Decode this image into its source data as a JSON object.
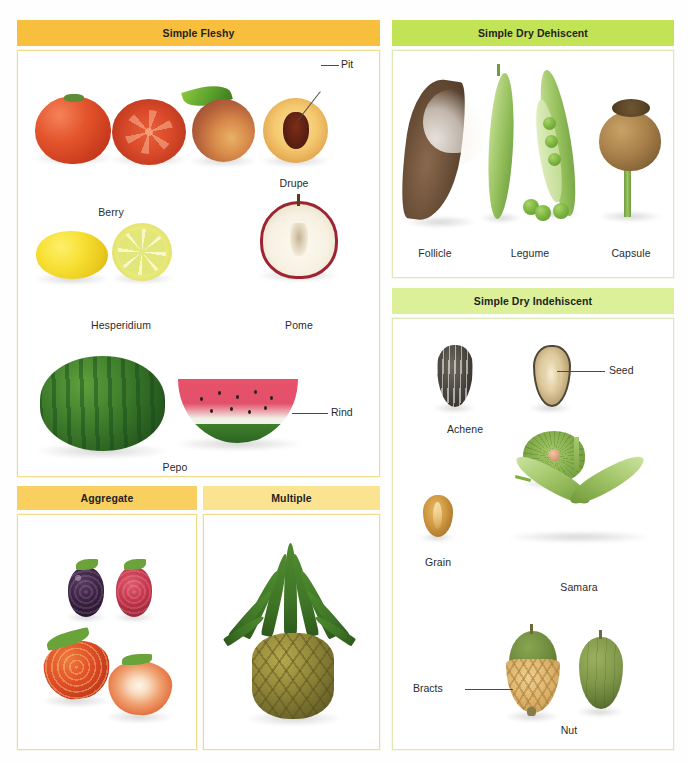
{
  "figure": {
    "panels": [
      {
        "id": "simple-fleshy",
        "header": "Simple Fleshy",
        "header_color": "#f8bf3f",
        "border_color": "#f2dc8a",
        "items": [
          {
            "label": "Berry",
            "illustration": "tomato-whole-and-cross-section"
          },
          {
            "label": "Drupe",
            "illustration": "peach-whole-and-halved"
          },
          {
            "label": "Hesperidium",
            "illustration": "lemon-whole-and-cross-section"
          },
          {
            "label": "Pome",
            "illustration": "apple-halved"
          },
          {
            "label": "Pepo",
            "illustration": "watermelon-whole-and-wedge"
          }
        ],
        "callouts": [
          {
            "label": "Pit",
            "points_to": "peach-stone"
          },
          {
            "label": "Rind",
            "points_to": "watermelon-rind"
          }
        ]
      },
      {
        "id": "simple-dry-dehiscent",
        "header": "Simple Dry Dehiscent",
        "header_color": "#c3e356",
        "border_color": "#dbe9b4",
        "items": [
          {
            "label": "Follicle",
            "illustration": "milkweed-pod-with-floss"
          },
          {
            "label": "Legume",
            "illustration": "pea-pods-closed-and-open-with-peas"
          },
          {
            "label": "Capsule",
            "illustration": "poppy-capsule"
          }
        ],
        "callouts": []
      },
      {
        "id": "simple-dry-indehiscent",
        "header": "Simple Dry Indehiscent",
        "header_color": "#dcf09a",
        "border_color": "#dbe9b4",
        "items": [
          {
            "label": "Achene",
            "illustration": "sunflower-seed-whole-and-sectioned"
          },
          {
            "label": "Grain",
            "illustration": "wheat-grain"
          },
          {
            "label": "Samara",
            "illustration": "elm-disc-and-maple-double-wing"
          },
          {
            "label": "Nut",
            "illustration": "acorn-with-cup-and-plain-nut"
          }
        ],
        "callouts": [
          {
            "label": "Seed",
            "points_to": "achene-kernel"
          },
          {
            "label": "Bracts",
            "points_to": "acorn-cup-scales"
          }
        ]
      },
      {
        "id": "aggregate",
        "header": "Aggregate",
        "header_color": "#f9cf5f",
        "border_color": "#f2dc8a",
        "items": [
          {
            "label": "",
            "illustration": "blackberry"
          },
          {
            "label": "",
            "illustration": "raspberry"
          },
          {
            "label": "",
            "illustration": "strawberry-whole"
          },
          {
            "label": "",
            "illustration": "strawberry-halved"
          }
        ],
        "callouts": []
      },
      {
        "id": "multiple",
        "header": "Multiple",
        "header_color": "#fbe491",
        "border_color": "#f2dc8a",
        "items": [
          {
            "label": "",
            "illustration": "pineapple"
          }
        ],
        "callouts": []
      }
    ]
  },
  "labels": {
    "simple_fleshy": "Simple Fleshy",
    "simple_dry_dehiscent": "Simple Dry Dehiscent",
    "simple_dry_indehiscent": "Simple Dry Indehiscent",
    "aggregate": "Aggregate",
    "multiple": "Multiple",
    "berry": "Berry",
    "drupe": "Drupe",
    "hesperidium": "Hesperidium",
    "pome": "Pome",
    "pepo": "Pepo",
    "pit": "Pit",
    "rind": "Rind",
    "follicle": "Follicle",
    "legume": "Legume",
    "capsule": "Capsule",
    "achene": "Achene",
    "seed": "Seed",
    "grain": "Grain",
    "samara": "Samara",
    "bracts": "Bracts",
    "nut": "Nut"
  }
}
